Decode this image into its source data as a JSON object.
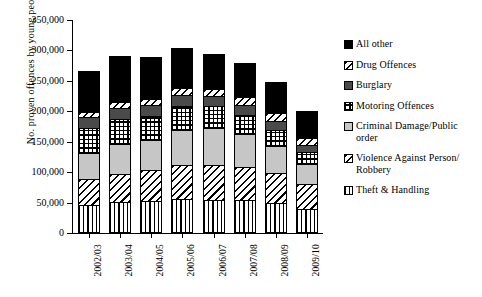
{
  "chart_data": {
    "type": "bar",
    "subtype": "stacked-vertical",
    "title": "",
    "xlabel": "",
    "ylabel": "No. proven offences by young people",
    "ylim": [
      0,
      350000
    ],
    "ytick_values": [
      0,
      50000,
      100000,
      150000,
      200000,
      250000,
      300000,
      350000
    ],
    "ytick_labels": [
      "0",
      "50,000",
      "100,000",
      "150,000",
      "200,000",
      "250,000",
      "300,000",
      "350,000"
    ],
    "grid": false,
    "legend_position": "right",
    "categories": [
      "2002/03",
      "2003/04",
      "2004/05",
      "2005/06",
      "2006/07",
      "2007/08",
      "2008/09",
      "2009/10"
    ],
    "series": [
      {
        "name": "Theft & Handling",
        "pattern": "vertical-lines",
        "values": [
          46000,
          51000,
          52000,
          56000,
          55000,
          54000,
          49000,
          39000
        ]
      },
      {
        "name": "Violence Against Person/ Robbery",
        "pattern": "diagonal-hatch",
        "values": [
          42000,
          46000,
          51000,
          55000,
          57000,
          54000,
          49000,
          41000
        ]
      },
      {
        "name": "Criminal Damage/Public order",
        "pattern": "light-gray",
        "values": [
          43000,
          49000,
          50000,
          58000,
          61000,
          55000,
          45000,
          34000
        ]
      },
      {
        "name": "Motoring Offences",
        "pattern": "grid-dots",
        "values": [
          42000,
          42000,
          40000,
          39000,
          35000,
          31000,
          27000,
          19000
        ]
      },
      {
        "name": "Burglary",
        "pattern": "dark-gray",
        "values": [
          17000,
          17000,
          17000,
          18000,
          17000,
          16000,
          14000,
          12000
        ]
      },
      {
        "name": "Drug Offences",
        "pattern": "diagonal-hatch",
        "values": [
          9000,
          10000,
          11000,
          12000,
          12000,
          13000,
          14000,
          11000
        ]
      },
      {
        "name": "All other",
        "pattern": "black",
        "values": [
          68000,
          76000,
          68000,
          66000,
          58000,
          56000,
          50000,
          45000
        ]
      }
    ],
    "totals": [
      267000,
      291000,
      289000,
      304000,
      295000,
      279000,
      248000,
      201000
    ]
  },
  "legend": {
    "items": [
      {
        "label": "All other",
        "swatch": "black"
      },
      {
        "label": "Drug Offences",
        "swatch": "diagonal-hatch"
      },
      {
        "label": "Burglary",
        "swatch": "dark-gray"
      },
      {
        "label": "Motoring Offences",
        "swatch": "grid-dots"
      },
      {
        "label": "Criminal Damage/Public order",
        "swatch": "light-gray"
      },
      {
        "label": "Violence Against Person/ Robbery",
        "swatch": "diagonal-hatch"
      },
      {
        "label": "Theft & Handling",
        "swatch": "vertical-lines"
      }
    ]
  }
}
